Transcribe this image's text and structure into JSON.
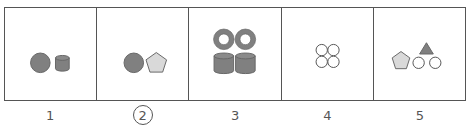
{
  "colors": {
    "border": "#555555",
    "dark_fill": "#808080",
    "light_fill": "#d9d9d9",
    "outline": "#555555",
    "background": "#ffffff"
  },
  "panels": [
    {
      "number": "1",
      "contents": [
        "dark-circle",
        "dark-cylinder"
      ],
      "selected": false
    },
    {
      "number": "2",
      "contents": [
        "dark-circle",
        "light-pentagon"
      ],
      "selected": true
    },
    {
      "number": "3",
      "contents": [
        "dark-ring",
        "dark-ring",
        "dark-cylinder",
        "dark-cylinder"
      ],
      "selected": false
    },
    {
      "number": "4",
      "contents": [
        "empty-circle",
        "empty-circle",
        "empty-circle",
        "empty-circle"
      ],
      "selected": false
    },
    {
      "number": "5",
      "contents": [
        "light-pentagon",
        "dark-triangle",
        "empty-circle",
        "empty-circle"
      ],
      "selected": false
    }
  ]
}
